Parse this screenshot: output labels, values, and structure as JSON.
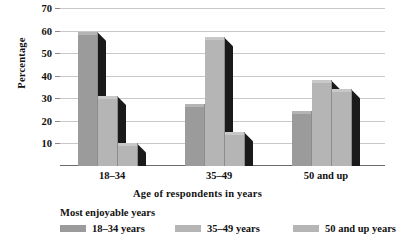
{
  "chart_data": {
    "type": "bar",
    "title": "",
    "xlabel": "Age of respondents in years",
    "ylabel": "Percentage",
    "categories": [
      "18–34",
      "35–49",
      "50 and up"
    ],
    "series": [
      {
        "name": "18–34 years",
        "values": [
          59.5,
          27.5,
          24.5
        ]
      },
      {
        "name": "35–49 years",
        "values": [
          31,
          57,
          38
        ]
      },
      {
        "name": "50 and up years",
        "values": [
          10,
          15,
          34
        ]
      }
    ],
    "ylim": [
      0,
      70
    ],
    "yticks": [
      10,
      20,
      30,
      40,
      50,
      60,
      70
    ],
    "ytick_labels": [
      "10",
      "20",
      "30",
      "40",
      "50",
      "60",
      "70"
    ],
    "grid": true,
    "legend_position": "below",
    "legend_title": "Most enjoyable years",
    "colors": {
      "bar_face_dark": "#9b9b9b",
      "bar_face_light": "#b5b5b5",
      "bar_side": "#1a1a1a",
      "gridline": "#c9c9c9",
      "axis": "#6b6b6b",
      "text": "#111111",
      "background": "#ffffff"
    }
  },
  "axes": {
    "y_title": "Percentage",
    "x_title": "Age of respondents in years"
  },
  "legend": {
    "title": "Most enjoyable years",
    "entries": [
      {
        "label": "18–34 years",
        "swatch": "#9b9b9b"
      },
      {
        "label": "35–49 years",
        "swatch": "#b5b5b5"
      },
      {
        "label": "50 and up years",
        "swatch": "#b5b5b5"
      }
    ]
  }
}
